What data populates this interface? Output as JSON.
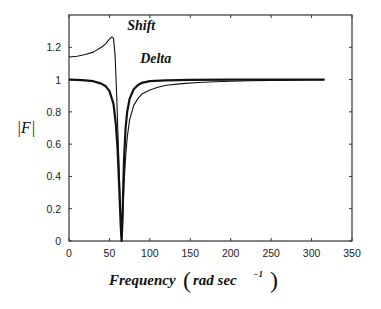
{
  "chart_data": {
    "type": "line",
    "title": "",
    "xlabel": "Frequency (rad sec^-1)",
    "xlabel_main": "Frequency",
    "xlabel_unit_base": "rad sec",
    "xlabel_unit_exp": "−1",
    "ylabel": "|F|",
    "xlim": [
      0,
      350
    ],
    "ylim": [
      0,
      1.4
    ],
    "xticks": [
      0,
      50,
      100,
      150,
      200,
      250,
      300,
      350
    ],
    "xtick_labels": [
      "0",
      "50",
      "100",
      "150",
      "200",
      "250",
      "300",
      "350"
    ],
    "yticks": [
      0,
      0.2,
      0.4,
      0.6,
      0.8,
      1,
      1.2
    ],
    "ytick_labels": [
      "0",
      "0.2",
      "0.4",
      "0.6",
      "0.8",
      "1",
      "1.2"
    ],
    "grid": false,
    "legend": "none",
    "annotations": [
      {
        "text": "Shift",
        "x": 72,
        "y": 1.31,
        "series": "Shift"
      },
      {
        "text": "Delta",
        "x": 88,
        "y": 1.1,
        "series": "Delta"
      }
    ],
    "series": [
      {
        "name": "Shift",
        "style": "thin",
        "x": [
          0,
          10,
          20,
          30,
          40,
          45,
          50,
          53,
          55,
          57,
          59,
          61,
          63,
          65,
          66,
          67,
          68,
          70,
          72,
          75,
          80,
          85,
          90,
          100,
          110,
          120,
          140,
          160,
          180,
          200,
          225,
          250,
          275,
          300,
          316
        ],
        "y": [
          1.14,
          1.145,
          1.155,
          1.17,
          1.2,
          1.22,
          1.25,
          1.265,
          1.255,
          1.15,
          0.9,
          0.6,
          0.3,
          0.0,
          0.1,
          0.22,
          0.35,
          0.52,
          0.64,
          0.75,
          0.84,
          0.88,
          0.91,
          0.935,
          0.953,
          0.965,
          0.975,
          0.982,
          0.987,
          0.99,
          0.993,
          0.995,
          0.997,
          0.999,
          1.0
        ]
      },
      {
        "name": "Delta",
        "style": "thick",
        "x": [
          0,
          10,
          20,
          30,
          40,
          45,
          50,
          55,
          58,
          60,
          62,
          64,
          65,
          66,
          67,
          68,
          70,
          72,
          75,
          80,
          85,
          90,
          100,
          120,
          150,
          200,
          250,
          316
        ],
        "y": [
          1.0,
          0.998,
          0.995,
          0.99,
          0.975,
          0.96,
          0.93,
          0.85,
          0.72,
          0.58,
          0.35,
          0.1,
          0.0,
          0.12,
          0.32,
          0.5,
          0.7,
          0.8,
          0.88,
          0.94,
          0.965,
          0.98,
          0.99,
          0.995,
          0.998,
          1.0,
          1.0,
          1.0
        ]
      }
    ]
  }
}
